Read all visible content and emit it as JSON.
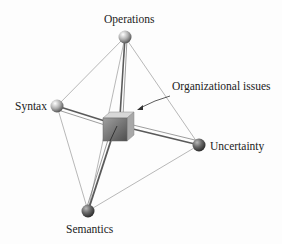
{
  "diagram": {
    "nodes": [
      {
        "id": "operations",
        "label": "Operations",
        "x": 125,
        "y": 37,
        "shade": "light"
      },
      {
        "id": "syntax",
        "label": "Syntax",
        "x": 57,
        "y": 106,
        "shade": "light"
      },
      {
        "id": "uncertainty",
        "label": "Uncertainty",
        "x": 199,
        "y": 145,
        "shade": "dark"
      },
      {
        "id": "semantics",
        "label": "Semantics",
        "x": 88,
        "y": 211,
        "shade": "dark"
      }
    ],
    "center": {
      "label": "Organizational issues",
      "shape": "cube"
    },
    "edges": [
      [
        "operations",
        "syntax"
      ],
      [
        "operations",
        "uncertainty"
      ],
      [
        "operations",
        "semantics"
      ],
      [
        "syntax",
        "semantics"
      ],
      [
        "semantics",
        "uncertainty"
      ],
      [
        "operations",
        "center"
      ],
      [
        "syntax",
        "center"
      ],
      [
        "uncertainty",
        "center"
      ],
      [
        "semantics",
        "center"
      ]
    ],
    "colors": {
      "line": "#8a8a8a",
      "strut": "#555555",
      "cube_front": "#7a7a7a",
      "cube_top": "#d0d0d0",
      "cube_side": "#a8a8a8"
    }
  }
}
